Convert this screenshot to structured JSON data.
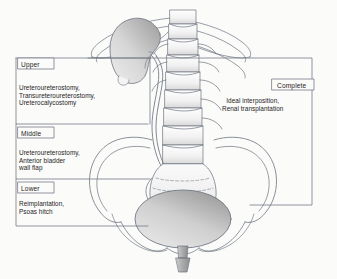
{
  "figure": {
    "background_color": "#fbfbfa",
    "line_color": "#6d7480",
    "text_color": "#1d1d1d"
  },
  "segments": [
    {
      "id": "upper",
      "tag": "Upper",
      "procedures": "Ureteroureterostomy,\nTransureteroureterostomy,\nUreterocalycostomy"
    },
    {
      "id": "middle",
      "tag": "Middle",
      "procedures": "Ureteroureterostomy,\nAnterior bladder\nwall flap"
    },
    {
      "id": "lower",
      "tag": "Lower",
      "procedures": "Reimplantation,\nPsoas hitch"
    },
    {
      "id": "complete",
      "tag": "Complete",
      "procedures": "Ideal interposition,\nRenal transplantation"
    }
  ],
  "anatomy": {
    "kidney": {
      "name": "kidney",
      "fill_light": "#f2f2f2",
      "fill_dark": "#a9a9a9"
    },
    "bladder": {
      "name": "bladder",
      "fill_light": "#efefef",
      "fill_dark": "#9e9e9e"
    },
    "ureter": {
      "name": "ureter"
    },
    "spine": {
      "name": "vertebral-column"
    },
    "ribs": {
      "name": "ribs"
    },
    "pelvis": {
      "name": "pelvis"
    },
    "sacrum": {
      "name": "sacrum"
    },
    "urethra": {
      "name": "urethra"
    }
  }
}
